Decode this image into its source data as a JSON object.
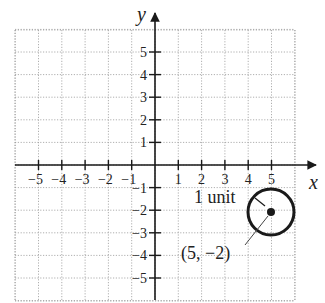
{
  "diagram": {
    "type": "coordinate-plane",
    "x_axis": {
      "label": "x",
      "ticks": [
        -5,
        -4,
        -3,
        -2,
        -1,
        1,
        2,
        3,
        4,
        5
      ],
      "tick_labels": [
        "−5",
        "−4",
        "−3",
        "−2",
        "−1",
        "1",
        "2",
        "3",
        "4",
        "5"
      ]
    },
    "y_axis": {
      "label": "y",
      "ticks": [
        5,
        4,
        3,
        2,
        1,
        -1,
        -2,
        -3,
        -4,
        -5
      ],
      "tick_labels": [
        "5",
        "4",
        "3",
        "2",
        "1",
        "−1",
        "−2",
        "−3",
        "−4",
        "−5"
      ]
    },
    "grid": {
      "x_range": [
        -6,
        6
      ],
      "y_range": [
        -6,
        6
      ],
      "style": "dotted"
    },
    "circle": {
      "center": [
        5,
        -2
      ],
      "radius": 1,
      "center_label": "(5, −2)",
      "radius_label": "1 unit"
    },
    "colors": {
      "axis": "#1a1a1a",
      "grid": "#9a9a9a",
      "text": "#222222",
      "background": "#ffffff"
    }
  }
}
